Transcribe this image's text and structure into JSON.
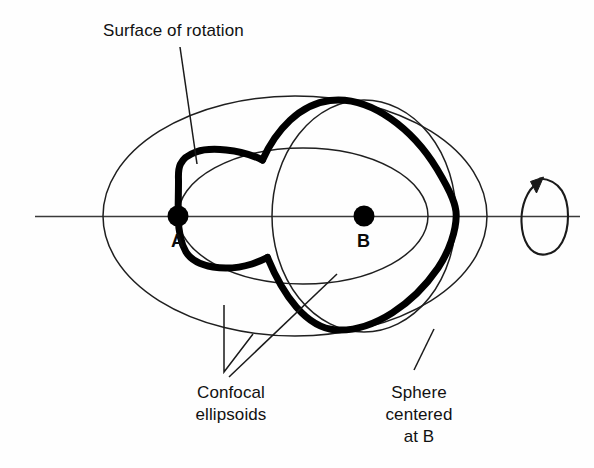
{
  "figure": {
    "background_color": "#fefefe",
    "ink_color": "#111111",
    "thin_stroke_color": "#1a1a1a",
    "bold_stroke_color": "#000000",
    "labels": {
      "surface_of_rotation": "Surface of rotation",
      "confocal_ellipsoids_line1": "Confocal",
      "confocal_ellipsoids_line2": "ellipsoids",
      "sphere_line1": "Sphere",
      "sphere_line2": "centered",
      "sphere_line3": "at B",
      "point_a": "A",
      "point_b": "B"
    },
    "geometry": {
      "axis": {
        "y": 216,
        "x_start": 35,
        "x_end": 580
      },
      "outer_ellipse": {
        "cx": 295,
        "cy": 216,
        "rx": 192,
        "ry": 120
      },
      "inner_ellipse": {
        "cx": 303,
        "cy": 216,
        "rx": 125,
        "ry": 68
      },
      "sphere": {
        "cx": 364,
        "cy": 216,
        "rx": 92,
        "ry": 116
      },
      "focus_a": {
        "cx": 178,
        "cy": 216,
        "r": 10
      },
      "focus_b": {
        "cx": 364,
        "cy": 216,
        "r": 10
      },
      "rotation_arrow": {
        "cx": 545,
        "cy": 216,
        "rx": 22,
        "ry": 39
      }
    }
  }
}
